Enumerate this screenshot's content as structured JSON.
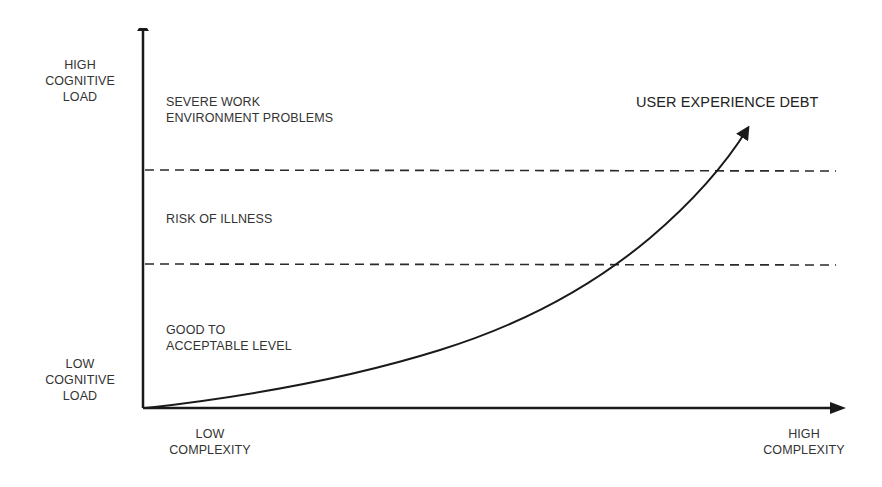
{
  "diagram": {
    "y_axis": {
      "top_label": [
        "HIGH",
        "COGNITIVE",
        "LOAD"
      ],
      "bottom_label": [
        "LOW",
        "COGNITIVE",
        "LOAD"
      ]
    },
    "x_axis": {
      "left_label": [
        "LOW",
        "COMPLEXITY"
      ],
      "right_label": [
        "HIGH",
        "COMPLEXITY"
      ]
    },
    "zones": [
      {
        "name": "severe",
        "label": [
          "SEVERE WORK",
          "ENVIRONMENT PROBLEMS"
        ]
      },
      {
        "name": "risk",
        "label": [
          "RISK OF ILLNESS"
        ]
      },
      {
        "name": "good",
        "label": [
          "GOOD TO",
          "ACCEPTABLE LEVEL"
        ]
      }
    ],
    "curve_label": "USER EXPERIENCE DEBT",
    "colors": {
      "line": "#1a1a1a",
      "text": "#333333",
      "dash": "#2a2a2a"
    }
  }
}
